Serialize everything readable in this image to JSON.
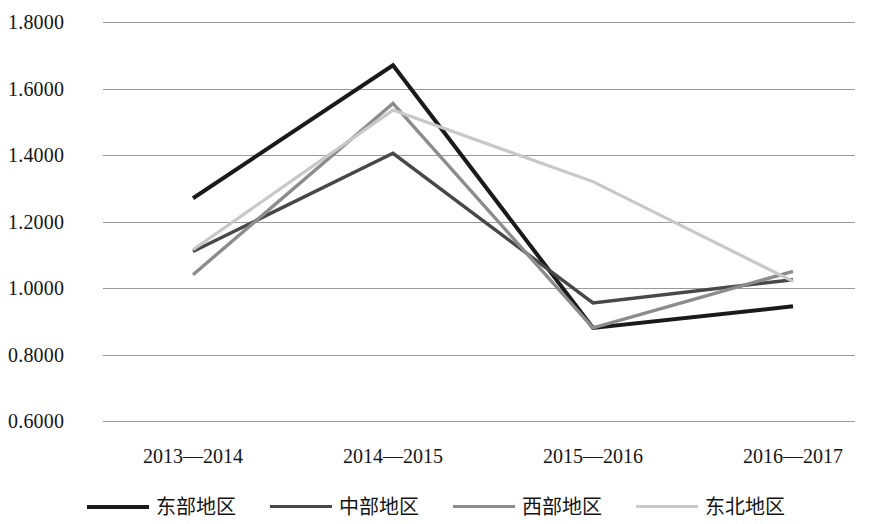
{
  "chart_data": {
    "type": "line",
    "title": "",
    "xlabel": "",
    "ylabel": "",
    "categories": [
      "2013—2014",
      "2014—2015",
      "2015—2016",
      "2016—2017"
    ],
    "ylim": [
      0.6,
      1.8
    ],
    "y_ticks": [
      "0.6000",
      "0.8000",
      "1.0000",
      "1.2000",
      "1.4000",
      "1.6000",
      "1.8000"
    ],
    "y_tick_values": [
      0.6,
      0.8,
      1.0,
      1.2,
      1.4,
      1.6,
      1.8
    ],
    "grid": "horizontal",
    "legend_position": "bottom",
    "series": [
      {
        "name": "东部地区",
        "color": "#1a1a1a",
        "values": [
          1.27,
          1.67,
          0.88,
          0.945
        ]
      },
      {
        "name": "中部地区",
        "color": "#484848",
        "values": [
          1.11,
          1.405,
          0.955,
          1.025
        ]
      },
      {
        "name": "西部地区",
        "color": "#8c8c8c",
        "values": [
          1.04,
          1.555,
          0.88,
          1.05
        ]
      },
      {
        "name": "东北地区",
        "color": "#c8c8c8",
        "values": [
          1.115,
          1.535,
          1.32,
          1.02
        ]
      }
    ]
  },
  "axis": {
    "gridline_color": "#9a9a9a"
  }
}
